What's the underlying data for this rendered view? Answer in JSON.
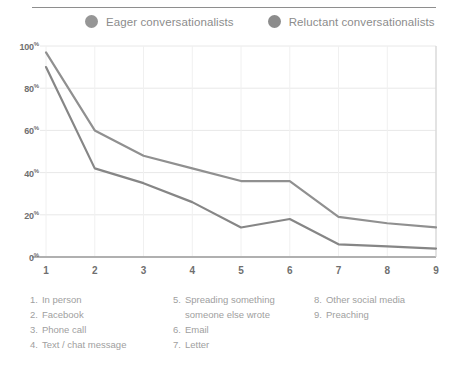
{
  "legend": {
    "items": [
      {
        "label": "Eager conversationalists",
        "color": "#969696",
        "marker": "circle-marker"
      },
      {
        "label": "Reluctant conversationalists",
        "color": "#8c8c8c",
        "marker": "circle-marker"
      }
    ]
  },
  "key_columns": [
    {
      "entries": [
        {
          "num": "1.",
          "text": "In person"
        },
        {
          "num": "2.",
          "text": "Facebook"
        },
        {
          "num": "3.",
          "text": "Phone call"
        },
        {
          "num": "4.",
          "text": "Text / chat message"
        }
      ]
    },
    {
      "entries": [
        {
          "num": "5.",
          "text": "Spreading something someone else wrote"
        },
        {
          "num": "6.",
          "text": "Email"
        },
        {
          "num": "7.",
          "text": "Letter"
        }
      ]
    },
    {
      "entries": [
        {
          "num": "8.",
          "text": "Other social media"
        },
        {
          "num": "9.",
          "text": "Preaching"
        }
      ]
    }
  ],
  "chart_data": {
    "type": "line",
    "title": "",
    "subtitle": "",
    "xlabel": "",
    "ylabel": "",
    "categories": [
      "1",
      "2",
      "3",
      "4",
      "5",
      "6",
      "7",
      "8",
      "9"
    ],
    "category_names": [
      "In person",
      "Facebook",
      "Phone call",
      "Text / chat message",
      "Spreading something someone else wrote",
      "Email",
      "Letter",
      "Other social media",
      "Preaching"
    ],
    "series": [
      {
        "name": "Eager conversationalists",
        "color": "#909090",
        "values": [
          97,
          60,
          48,
          42,
          36,
          36,
          19,
          16,
          14
        ]
      },
      {
        "name": "Reluctant conversationalists",
        "color": "#868686",
        "values": [
          90,
          42,
          35,
          26,
          14,
          18,
          6,
          5,
          4
        ]
      }
    ],
    "ylim": [
      0,
      100
    ],
    "yticks": [
      0,
      20,
      40,
      60,
      80,
      100
    ],
    "ytick_labels": [
      "0%",
      "20%",
      "40%",
      "60%",
      "80%",
      "100%"
    ],
    "grid": true,
    "grid_color": "#e8e8e8",
    "legend_position": "top"
  }
}
